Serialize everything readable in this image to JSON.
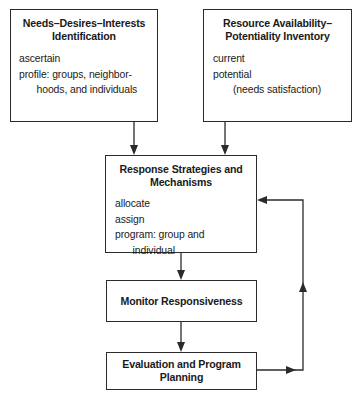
{
  "figure": {
    "type": "flowchart",
    "orientation": "top-down with feedback loop"
  },
  "boxes": {
    "needs": {
      "title": "Needs–Desires–Interests\nIdentification",
      "lines": [
        "ascertain",
        "profile: groups, neighbor-\n  hoods, and individuals"
      ]
    },
    "resource": {
      "title": "Resource\nAvailability–Potentiality\nInventory",
      "lines": [
        "current",
        "potential",
        "(needs satisfaction)"
      ]
    },
    "response": {
      "title": "Response Strategies\nand Mechanisms",
      "lines": [
        "allocate",
        "assign",
        "program: group and\n  individual"
      ]
    },
    "monitor": {
      "title": "Monitor\nResponsiveness"
    },
    "evaluation": {
      "title": "Evaluation and\nProgram Planning"
    }
  },
  "connectors": [
    {
      "name": "needs-to-response",
      "from": "needs",
      "to": "response",
      "direction": "down"
    },
    {
      "name": "resource-to-response",
      "from": "resource",
      "to": "response",
      "direction": "down"
    },
    {
      "name": "response-to-monitor",
      "from": "response",
      "to": "monitor",
      "direction": "down"
    },
    {
      "name": "monitor-to-evaluation",
      "from": "monitor",
      "to": "evaluation",
      "direction": "down"
    },
    {
      "name": "evaluation-feedback-to-response",
      "from": "evaluation",
      "to": "response",
      "direction": "right-up-left"
    }
  ],
  "colors": {
    "stroke": "#2b2b2b",
    "background": "#ffffff",
    "text": "#1a1a1a"
  }
}
